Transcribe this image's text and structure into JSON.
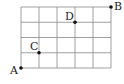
{
  "diagram": {
    "grid": {
      "columns": 5,
      "rows": 4,
      "x0": 21,
      "y0": 7,
      "cell_w": 18,
      "cell_h": 15.25,
      "line_color": "#888888"
    },
    "points": [
      {
        "label": "A",
        "col": 0,
        "row": 4,
        "lx": 10,
        "ly": 74
      },
      {
        "label": "C",
        "col": 1,
        "row": 3,
        "lx": 30,
        "ly": 50
      },
      {
        "label": "D",
        "col": 3,
        "row": 1,
        "lx": 65,
        "ly": 20
      },
      {
        "label": "B",
        "col": 5,
        "row": 0,
        "lx": 114,
        "ly": 10
      }
    ],
    "point_color": "#111111"
  }
}
